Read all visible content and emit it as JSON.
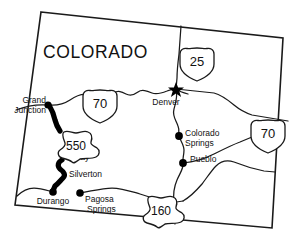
{
  "map": {
    "title": "COLORADO",
    "title_position": {
      "x": 43,
      "y": 58
    },
    "kind": "state-highway-map",
    "background_color": "#ffffff",
    "line_color": "#1a1a1a",
    "marker_color": "#000000"
  },
  "state_border": {
    "name": "colorado-state-border",
    "points": "41,12 283,38 272,228 15,205"
  },
  "cities": [
    {
      "name": "Grand Junction",
      "label_lines": [
        "Grand",
        "Junction"
      ],
      "dot": {
        "cx": 48,
        "cy": 105,
        "r": 3.6
      },
      "label_anchor": "end",
      "label_x": 46,
      "label_y": 106,
      "marker_type": "dot"
    },
    {
      "name": "Ouray",
      "label_lines": [
        "Ouray"
      ],
      "dot": null,
      "label_anchor": "start",
      "label_x": 66,
      "label_y": 160,
      "marker_type": "none"
    },
    {
      "name": "Silverton",
      "label_lines": [
        "Silverton"
      ],
      "dot": null,
      "label_anchor": "start",
      "label_x": 68,
      "label_y": 176,
      "marker_type": "none"
    },
    {
      "name": "Durango",
      "label_lines": [
        "Durango"
      ],
      "dot": {
        "cx": 53,
        "cy": 192,
        "r": 3.8
      },
      "label_anchor": "mid",
      "label_x": 53,
      "label_y": 204,
      "marker_type": "dot"
    },
    {
      "name": "Pagosa Springs",
      "label_lines": [
        "Pagosa",
        "Springs"
      ],
      "dot": {
        "cx": 80,
        "cy": 193,
        "r": 3.8
      },
      "label_anchor": "start",
      "label_x": 85,
      "label_y": 203,
      "marker_type": "dot"
    },
    {
      "name": "Denver",
      "label_lines": [
        "Denver"
      ],
      "dot": {
        "cx": 176,
        "cy": 89,
        "r": 5.2
      },
      "label_anchor": "mid",
      "label_x": 165,
      "label_y": 104,
      "marker_type": "star"
    },
    {
      "name": "Colorado Springs",
      "label_lines": [
        "Colorado",
        "Springs"
      ],
      "dot": {
        "cx": 179,
        "cy": 136,
        "r": 3.9
      },
      "label_anchor": "start",
      "label_x": 184,
      "label_y": 136,
      "marker_type": "dot"
    },
    {
      "name": "Pueblo",
      "label_lines": [
        "Pueblo"
      ],
      "dot": {
        "cx": 183,
        "cy": 163,
        "r": 3.9
      },
      "label_anchor": "start",
      "label_x": 189,
      "label_y": 161,
      "marker_type": "dot"
    }
  ],
  "highway_shields": [
    {
      "name": "interstate-70-west",
      "route": "70",
      "type": "interstate",
      "x": 83,
      "y": 90,
      "width": 34,
      "height": 33
    },
    {
      "name": "interstate-25",
      "route": "25",
      "type": "interstate",
      "x": 180,
      "y": 48,
      "width": 34,
      "height": 33
    },
    {
      "name": "interstate-70-east",
      "route": "70",
      "type": "interstate",
      "x": 251,
      "y": 120,
      "width": 34,
      "height": 33
    },
    {
      "name": "us-550",
      "route": "550",
      "type": "us-route",
      "x": 60,
      "y": 131,
      "width": 40,
      "height": 32
    },
    {
      "name": "us-160",
      "route": "160",
      "type": "us-route",
      "x": 145,
      "y": 196,
      "width": 40,
      "height": 32
    }
  ],
  "roads": [
    {
      "name": "interstate-70-route",
      "style": "thin",
      "path": "M 16,110 C 26,106 36,104 48,105 C 58,106 64,104 70,100 C 76,96 82,93 88,95 C 94,97 98,101 101,101 C 106,101 110,96 114,93 C 118,90 122,92 126,94 C 130,96 134,95 138,92 C 142,89 147,91 152,93 C 157,95 162,93 167,91 C 171,89 174,89 176,89 L 214,93 C 222,95 228,100 234,105 C 240,110 246,113 252,115 L 288,121"
    },
    {
      "name": "interstate-25-route",
      "style": "thin",
      "path": "M 176,89 L 177,78 C 177,70 178,62 179,54 L 181,26"
    },
    {
      "name": "i25-south-route",
      "style": "thin",
      "path": "M 176,89 C 178,96 176,102 174,109 C 172,116 176,120 178,126 C 180,131 178,133 179,136 C 180,140 184,145 184,150 C 184,156 182,160 183,163 C 184,168 180,173 177,180 C 174,187 173,194 174,202 L 175,224"
    },
    {
      "name": "us-160-east-route",
      "style": "thin",
      "path": "M 80,193 C 92,191 102,188 112,188 C 122,188 130,191 140,194 C 150,197 158,200 166,202 C 172,203 178,202 183,201"
    },
    {
      "name": "us-160-west-route",
      "style": "thin",
      "path": "M 53,192 C 46,190 40,188 34,188 C 28,188 22,191 17,196"
    },
    {
      "name": "us-160-to-pueblo-route",
      "style": "thin",
      "path": "M 183,201 C 190,197 196,191 202,184 C 208,176 212,170 216,166 C 222,160 228,160 234,162 C 244,166 254,169 264,171 L 275,172"
    },
    {
      "name": "pueblo-east-route",
      "style": "thin",
      "path": "M 183,163 C 194,162 204,159 214,154 C 224,149 232,145 240,142 L 252,137"
    },
    {
      "name": "denver-south-connector",
      "style": "thin",
      "path": "M 176,89 C 180,92 184,93 188,94"
    }
  ],
  "scenic_route": {
    "name": "us-550-million-dollar-highway",
    "label": "550",
    "path": "M 49,105 C 52,110 54,115 55,120 C 56,124 58,128 60,131 M 62,160 C 58,162 57,166 60,169 C 64,172 66,175 63,178 C 60,181 58,184 55,186 C 54,188 53,190 53,192"
  },
  "icons": {
    "capital_star": "star-icon",
    "city_dot": "dot-icon",
    "us_shield": "us-highway-shield-icon",
    "interstate_shield": "interstate-shield-icon"
  }
}
